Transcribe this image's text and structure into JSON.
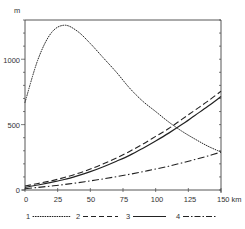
{
  "chart_data": {
    "type": "line",
    "title": "",
    "xlabel": "km",
    "ylabel": "m",
    "xlim": [
      0,
      150
    ],
    "ylim": [
      0,
      1300
    ],
    "x_ticks": [
      0,
      25,
      50,
      75,
      100,
      125,
      150
    ],
    "x_tick_labels": [
      "0",
      "25",
      "50",
      "75",
      "100",
      "125",
      "150 km"
    ],
    "y_ticks": [
      0,
      500,
      1000
    ],
    "y_tick_labels": [
      "0",
      "500",
      "1000"
    ],
    "y_minor_tick_step": 100,
    "grid": false,
    "legend_position": "bottom",
    "x": [
      0,
      10,
      20,
      30,
      40,
      50,
      60,
      70,
      80,
      90,
      100,
      110,
      120,
      130,
      140,
      150
    ],
    "series": [
      {
        "name": "1",
        "style": "dotted",
        "values": [
          670,
          1000,
          1200,
          1260,
          1215,
          1120,
          1010,
          900,
          780,
          680,
          600,
          520,
          450,
          390,
          335,
          290
        ]
      },
      {
        "name": "2",
        "style": "dashed",
        "values": [
          30,
          50,
          70,
          95,
          125,
          160,
          200,
          245,
          295,
          350,
          410,
          470,
          540,
          610,
          680,
          755
        ]
      },
      {
        "name": "3",
        "style": "solid",
        "values": [
          20,
          38,
          58,
          80,
          108,
          140,
          178,
          220,
          265,
          318,
          375,
          435,
          500,
          570,
          640,
          715
        ]
      },
      {
        "name": "4",
        "style": "dash-dot",
        "values": [
          10,
          20,
          30,
          42,
          55,
          70,
          85,
          102,
          120,
          140,
          160,
          182,
          207,
          233,
          260,
          290
        ]
      }
    ]
  },
  "axis": {
    "y_unit": "m"
  },
  "legend": [
    {
      "label": "1"
    },
    {
      "label": "2"
    },
    {
      "label": "3"
    },
    {
      "label": "4"
    }
  ]
}
